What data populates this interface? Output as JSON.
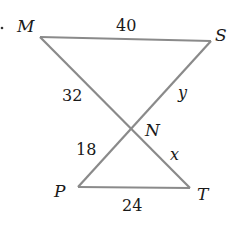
{
  "diagram": {
    "type": "two triangles sharing vertex N (bowtie / vertical angles)",
    "vertices": {
      "M": {
        "label": "M",
        "x": 40,
        "y": 37
      },
      "S": {
        "label": "S",
        "x": 211,
        "y": 41
      },
      "N": {
        "label": "N",
        "x": 130,
        "y": 129
      },
      "P": {
        "label": "P",
        "x": 78,
        "y": 187
      },
      "T": {
        "label": "T",
        "x": 190,
        "y": 188
      }
    },
    "segments": [
      {
        "from": "M",
        "to": "S",
        "label": "40"
      },
      {
        "from": "M",
        "to": "N",
        "label": "32"
      },
      {
        "from": "S",
        "to": "N",
        "label": "y"
      },
      {
        "from": "N",
        "to": "P",
        "label": "18"
      },
      {
        "from": "N",
        "to": "T",
        "label": "x"
      },
      {
        "from": "P",
        "to": "T",
        "label": "24"
      }
    ],
    "line_color": "#8a8a8a",
    "text_color": "#1a1a1a"
  }
}
